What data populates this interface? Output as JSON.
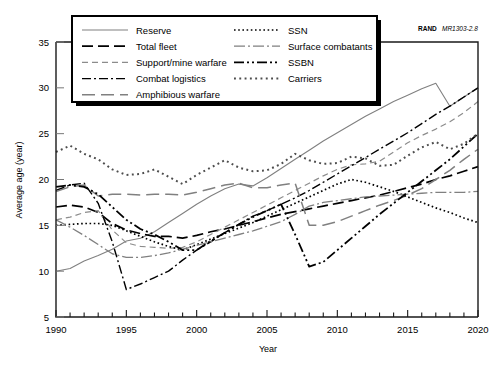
{
  "figure": {
    "source_brand": "RAND",
    "source_number": "MR1303-2.8"
  },
  "chart_data": {
    "type": "line",
    "title": "",
    "xlabel": "Year",
    "ylabel": "Average age (year)",
    "xlim": [
      1990,
      2020
    ],
    "ylim": [
      5,
      35
    ],
    "xticks": [
      1990,
      1995,
      2000,
      2005,
      2010,
      2015,
      2020
    ],
    "yticks": [
      5,
      10,
      15,
      20,
      25,
      30,
      35
    ],
    "xtick_labels": [
      "1990",
      "1995",
      "2000",
      "2005",
      "2010",
      "2015",
      "2020"
    ],
    "ytick_labels": [
      "5",
      "10",
      "15",
      "20",
      "25",
      "30",
      "35"
    ],
    "minor_xtick_interval": 1,
    "grid": false,
    "legend_position": "top-left",
    "x": [
      1990,
      1991,
      1992,
      1993,
      1994,
      1995,
      1996,
      1997,
      1998,
      1999,
      2000,
      2001,
      2002,
      2003,
      2004,
      2005,
      2006,
      2007,
      2008,
      2009,
      2010,
      2011,
      2012,
      2013,
      2014,
      2015,
      2016,
      2017,
      2018,
      2019,
      2020
    ],
    "series": [
      {
        "name": "Reserve",
        "style": "solid",
        "color": "#808080",
        "values": [
          10.0,
          10.3,
          11.1,
          11.7,
          12.4,
          13.3,
          13.6,
          14.3,
          15.3,
          16.3,
          17.3,
          18.2,
          19.0,
          19.5,
          19.3,
          20.2,
          21.2,
          22.2,
          23.2,
          24.2,
          25.1,
          26.0,
          26.9,
          27.7,
          28.5,
          29.2,
          29.9,
          30.5,
          28.0,
          29.0,
          30.0
        ]
      },
      {
        "name": "Total fleet",
        "style": "dashed-long",
        "color": "#000000",
        "values": [
          17.0,
          17.2,
          17.0,
          16.4,
          15.2,
          14.5,
          14.1,
          13.8,
          13.8,
          13.6,
          13.9,
          14.3,
          14.6,
          15.0,
          15.4,
          15.8,
          16.2,
          16.5,
          16.8,
          17.1,
          17.4,
          17.7,
          18.0,
          18.3,
          18.7,
          19.1,
          19.5,
          20.0,
          20.4,
          20.9,
          21.4
        ]
      },
      {
        "name": "Support/mine warfare",
        "style": "dashed-short",
        "color": "#8c8c8c",
        "values": [
          15.6,
          15.9,
          16.4,
          16.6,
          14.5,
          13.1,
          12.7,
          12.6,
          12.5,
          12.6,
          13.2,
          14.0,
          14.8,
          15.6,
          16.4,
          17.2,
          18.0,
          18.8,
          19.6,
          20.4,
          21.1,
          21.6,
          21.7,
          22.0,
          23.0,
          24.0,
          24.8,
          25.5,
          26.3,
          27.3,
          28.5
        ]
      },
      {
        "name": "Combat logistics",
        "style": "dash-dot",
        "color": "#000000",
        "values": [
          18.8,
          19.4,
          19.6,
          17.4,
          13.2,
          8.0,
          8.6,
          9.3,
          10.0,
          11.2,
          12.3,
          13.2,
          14.2,
          15.1,
          16.0,
          16.6,
          17.3,
          18.0,
          18.8,
          19.7,
          20.6,
          21.5,
          22.4,
          23.3,
          24.2,
          25.1,
          26.1,
          27.1,
          28.0,
          29.0,
          30.0
        ]
      },
      {
        "name": "Amphibious warfare",
        "style": "dashed-medium",
        "color": "#808080",
        "values": [
          18.7,
          19.2,
          19.4,
          18.2,
          18.4,
          18.4,
          18.3,
          18.4,
          18.4,
          18.3,
          18.6,
          19.0,
          19.4,
          19.6,
          19.1,
          19.1,
          19.4,
          19.6,
          15.0,
          15.0,
          15.4,
          16.0,
          16.6,
          17.2,
          17.7,
          18.3,
          19.0,
          20.0,
          21.0,
          22.2,
          23.3
        ]
      },
      {
        "name": "SSN",
        "style": "dotted-fine",
        "color": "#000000",
        "values": [
          15.0,
          15.1,
          15.2,
          15.2,
          15.0,
          14.4,
          13.8,
          13.2,
          12.7,
          12.3,
          12.9,
          13.5,
          14.1,
          14.7,
          15.3,
          16.0,
          16.7,
          17.4,
          18.1,
          18.8,
          19.5,
          20.0,
          19.7,
          19.2,
          18.7,
          18.1,
          17.5,
          16.9,
          16.4,
          15.8,
          15.3
        ]
      },
      {
        "name": "Surface combatants",
        "style": "dash-dot-gray",
        "color": "#808080",
        "values": [
          15.6,
          14.8,
          13.9,
          12.9,
          11.9,
          11.5,
          11.5,
          11.7,
          12.0,
          12.4,
          12.8,
          13.2,
          13.6,
          14.0,
          14.4,
          14.9,
          15.4,
          16.2,
          17.1,
          17.5,
          17.7,
          17.9,
          18.1,
          18.2,
          18.3,
          18.4,
          18.5,
          18.6,
          18.6,
          18.6,
          18.7
        ]
      },
      {
        "name": "SSBN",
        "style": "dash-dot-dot",
        "color": "#000000",
        "values": [
          19.2,
          19.4,
          19.2,
          18.4,
          17.0,
          15.6,
          14.6,
          14.0,
          13.2,
          12.3,
          12.3,
          13.3,
          14.2,
          15.1,
          15.9,
          16.6,
          17.3,
          14.0,
          10.5,
          11.0,
          12.3,
          13.6,
          14.9,
          16.2,
          17.4,
          18.6,
          19.8,
          21.0,
          22.2,
          23.6,
          25.0
        ]
      },
      {
        "name": "Carriers",
        "style": "dotted-coarse",
        "color": "#4d4d4d",
        "values": [
          23.0,
          23.7,
          22.8,
          22.2,
          21.1,
          20.5,
          20.6,
          21.1,
          20.3,
          19.5,
          20.5,
          21.3,
          22.1,
          21.3,
          20.9,
          21.0,
          21.7,
          22.8,
          22.1,
          21.7,
          21.8,
          22.5,
          22.3,
          21.5,
          21.6,
          22.6,
          23.5,
          24.1,
          23.3,
          23.9,
          25.0
        ]
      }
    ]
  },
  "legend": {
    "items": [
      {
        "label": "Reserve"
      },
      {
        "label": "Total fleet"
      },
      {
        "label": "Support/mine warfare"
      },
      {
        "label": "Combat logistics"
      },
      {
        "label": "Amphibious warfare"
      },
      {
        "label": "SSN"
      },
      {
        "label": "Surface combatants"
      },
      {
        "label": "SSBN"
      },
      {
        "label": "Carriers"
      }
    ]
  }
}
